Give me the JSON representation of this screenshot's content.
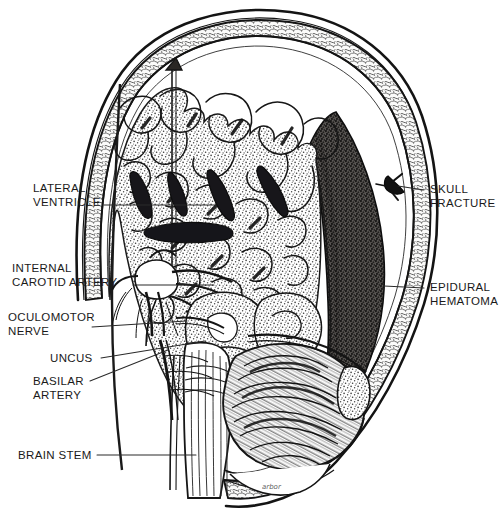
{
  "figure": {
    "view": "coronal-section",
    "style": "pen-and-ink stipple medical illustration",
    "background_color": "#ffffff",
    "ink_color": "#141414",
    "hematoma_color": "#2e2c2b",
    "brain_tone": "#9b9892",
    "bone_tone": "#cfcbc4"
  },
  "labels": {
    "lateral_ventricle": "LATERAL\nVENTRICLE",
    "internal_carotid_artery": "INTERNAL\nCAROTID ARTERY",
    "oculomotor_nerve": "OCULOMOTOR\nNERVE",
    "uncus": "UNCUS",
    "basilar_artery": "BASILAR\nARTERY",
    "brain_stem": "BRAIN STEM",
    "skull_fracture": "SKULL\nFRACTURE",
    "epidural_hematoma": "EPIDURAL\nHEMATOMA"
  },
  "anatomy_structures": [
    "scalp",
    "skull outer table",
    "diploe",
    "skull inner table",
    "dura mater",
    "epidural hematoma",
    "cerebral cortex gyri",
    "cerebral white matter",
    "falx cerebri",
    "lateral ventricle",
    "internal carotid artery",
    "circle of Willis",
    "oculomotor nerve",
    "uncus",
    "basilar artery",
    "midbrain",
    "pons",
    "medulla",
    "brain stem",
    "cerebellum",
    "tentorium cerebelli",
    "transverse sinus"
  ]
}
